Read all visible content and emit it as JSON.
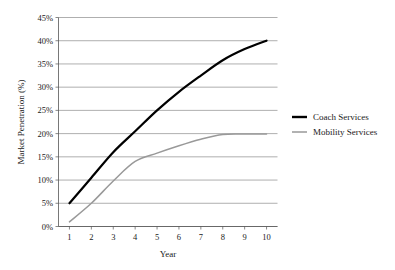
{
  "chart_data": {
    "type": "line",
    "title": "",
    "xlabel": "Year",
    "ylabel": "Market Penetration (%)",
    "x": [
      1,
      2,
      3,
      4,
      5,
      6,
      7,
      8,
      9,
      10
    ],
    "categories": [
      "1",
      "2",
      "3",
      "4",
      "5",
      "6",
      "7",
      "8",
      "9",
      "10"
    ],
    "xlim": [
      0.5,
      10.5
    ],
    "ylim": [
      0,
      45
    ],
    "ytick_values": [
      0,
      5,
      10,
      15,
      20,
      25,
      30,
      35,
      40,
      45
    ],
    "ytick_labels": [
      "0%",
      "5%",
      "10%",
      "15%",
      "20%",
      "25%",
      "30%",
      "35%",
      "40%",
      "45%"
    ],
    "xtick_labels": [
      "1",
      "2",
      "3",
      "4",
      "5",
      "6",
      "7",
      "8",
      "9",
      "10"
    ],
    "grid": "horizontal",
    "legend_position": "right",
    "series": [
      {
        "name": "Coach Services",
        "color": "#000000",
        "width": 2.2,
        "values": [
          5,
          10.5,
          16,
          20.5,
          25,
          29,
          32.5,
          35.8,
          38.2,
          40
        ]
      },
      {
        "name": "Mobility Services",
        "color": "#999999",
        "width": 1.5,
        "values": [
          1,
          5,
          9.8,
          14,
          15.8,
          17.4,
          18.8,
          19.8,
          19.9,
          19.9
        ]
      }
    ]
  },
  "legend": {
    "entries": [
      {
        "label": "Coach Services",
        "color": "#000000",
        "width": 2.4
      },
      {
        "label": "Mobility Services",
        "color": "#999999",
        "width": 1.5
      }
    ]
  },
  "colors": {
    "background": "#ffffff",
    "grid": "#8c8c8c",
    "axis": "#555555",
    "text": "#1a1a1a"
  }
}
